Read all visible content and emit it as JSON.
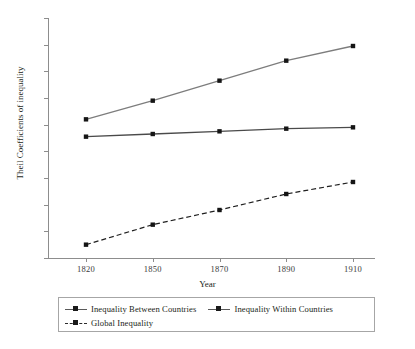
{
  "chart_data": {
    "type": "line",
    "title": "",
    "xlabel": "Year",
    "ylabel": "Theil Coefficients of inequality",
    "categories": [
      "1820",
      "1850",
      "1870",
      "1890",
      "1910"
    ],
    "x": [
      1820,
      1850,
      1870,
      1890,
      1910
    ],
    "ylim": [
      0,
      0.9
    ],
    "yticks": [
      "0",
      "0.1",
      "0.2",
      "0.3",
      "0.4",
      "0.5",
      "0.6",
      "0.7",
      "0.8",
      "0.9"
    ],
    "ytick_values": [
      0,
      0.1,
      0.2,
      0.3,
      0.4,
      0.5,
      0.6,
      0.7,
      0.8,
      0.9
    ],
    "grid": false,
    "legend_position": "bottom",
    "series": [
      {
        "name": "Inequality Between Countries",
        "values": [
          0.52,
          0.59,
          0.665,
          0.74,
          0.795
        ],
        "style": "solid",
        "color": "#7d7d7d",
        "marker": "square"
      },
      {
        "name": "Inequality Within Countries",
        "values": [
          0.455,
          0.465,
          0.475,
          0.485,
          0.49
        ],
        "style": "solid",
        "color": "#4a4a4a",
        "marker": "square"
      },
      {
        "name": "Global Inequality",
        "values": [
          0.05,
          0.125,
          0.18,
          0.24,
          0.285
        ],
        "style": "dashed",
        "color": "#1f1f1f",
        "marker": "square"
      }
    ]
  },
  "axis": {
    "x_title": "Year",
    "y_title": "Theil Coefficients of inequality"
  },
  "legend": {
    "items": [
      {
        "label": "Inequality Between Countries"
      },
      {
        "label": "Inequality Within Countries"
      },
      {
        "label": "Global Inequality"
      }
    ]
  },
  "caption": {
    "text": ""
  }
}
